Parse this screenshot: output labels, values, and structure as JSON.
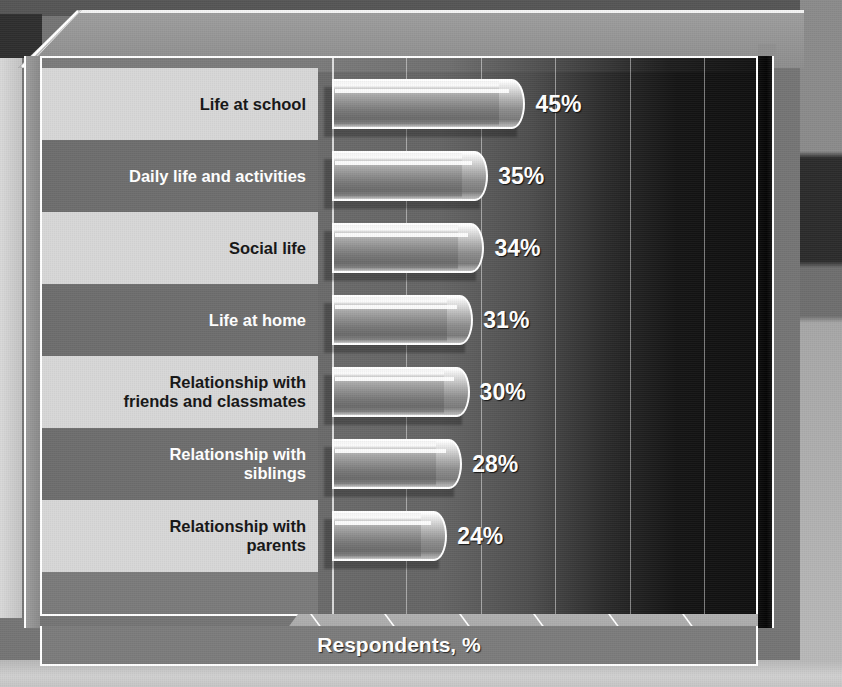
{
  "chart_data": {
    "type": "bar",
    "orientation": "horizontal",
    "title": "",
    "xlabel": "Respondents, %",
    "ylabel": "",
    "xlim": [
      0,
      110
    ],
    "grid": true,
    "legend": "none",
    "xticks": [
      "0%",
      "20%",
      "40%",
      "60%",
      "80%",
      "100%"
    ],
    "xtick_values": [
      0,
      20,
      40,
      60,
      80,
      100
    ],
    "categories": [
      "Life at school",
      "Daily life and activities",
      "Social life",
      "Life at home",
      "Relationship with friends and classmates",
      "Relationship with siblings",
      "Relationship with parents"
    ],
    "values": [
      45,
      35,
      34,
      31,
      30,
      28,
      24
    ],
    "data_labels": [
      "45%",
      "35%",
      "34%",
      "31%",
      "30%",
      "28%",
      "24%"
    ]
  },
  "rows": [
    {
      "label_line1": "Life at school",
      "label_line2": "",
      "value": 45,
      "value_label": "45%",
      "band": "light"
    },
    {
      "label_line1": "Daily life and activities",
      "label_line2": "",
      "value": 35,
      "value_label": "35%",
      "band": "dark"
    },
    {
      "label_line1": "Social life",
      "label_line2": "",
      "value": 34,
      "value_label": "34%",
      "band": "light"
    },
    {
      "label_line1": "Life at home",
      "label_line2": "",
      "value": 31,
      "value_label": "31%",
      "band": "dark"
    },
    {
      "label_line1": "Relationship with",
      "label_line2": "friends and classmates",
      "value": 30,
      "value_label": "30%",
      "band": "light"
    },
    {
      "label_line1": "Relationship with",
      "label_line2": "siblings",
      "value": 28,
      "value_label": "28%",
      "band": "dark"
    },
    {
      "label_line1": "Relationship with",
      "label_line2": "parents",
      "value": 24,
      "value_label": "24%",
      "band": "light"
    }
  ],
  "axis": {
    "title": "Respondents, %",
    "ticks": [
      "0%",
      "20%",
      "40%",
      "60%",
      "80%",
      "100%"
    ]
  },
  "colors": {
    "panel_border": "#ffffff",
    "band_light": "#d6d6d6",
    "band_dark": "#6d6d6d",
    "label_text_on_light": "#151515",
    "label_text_on_dark": "#ffffff",
    "value_text": "#ffffff",
    "plot_background_start": "#6a6a6a",
    "plot_background_end": "#101010",
    "bar_highlight": "#ffffff",
    "axis_base": "#a2a2a2"
  }
}
